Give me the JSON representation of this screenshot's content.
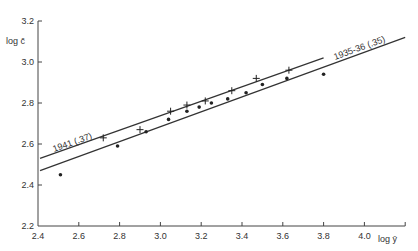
{
  "chart_data": {
    "type": "scatter",
    "title": "",
    "xlabel": "log ȳ",
    "ylabel": "log c̄",
    "xlim": [
      2.4,
      4.2
    ],
    "ylim": [
      2.2,
      3.2
    ],
    "xticks": [
      2.4,
      2.6,
      2.8,
      3.0,
      3.2,
      3.4,
      3.6,
      3.8,
      4.0
    ],
    "xtick_labels": [
      "2.4",
      "2.6",
      "2.8",
      "3.0",
      "3.2",
      "3.4",
      "3.6",
      "3.8",
      "4.0"
    ],
    "yticks": [
      2.2,
      2.4,
      2.6,
      2.8,
      3.0,
      3.2
    ],
    "ytick_labels": [
      "2.2",
      "2.4",
      "2.6",
      "2.8",
      "3.0",
      "3.2"
    ],
    "grid": false,
    "legend": "inline line labels",
    "series": [
      {
        "name": "1941",
        "marker": "plus",
        "x": [
          2.72,
          2.9,
          3.05,
          3.13,
          3.22,
          3.35,
          3.47,
          3.63
        ],
        "y": [
          2.63,
          2.67,
          2.76,
          2.79,
          2.81,
          2.86,
          2.92,
          2.96
        ]
      },
      {
        "name": "1935-36",
        "marker": "dot",
        "x": [
          2.51,
          2.79,
          2.93,
          3.04,
          3.13,
          3.19,
          3.25,
          3.33,
          3.42,
          3.5,
          3.62,
          3.8
        ],
        "y": [
          2.45,
          2.59,
          2.66,
          2.72,
          2.76,
          2.78,
          2.8,
          2.82,
          2.85,
          2.89,
          2.92,
          2.94
        ]
      }
    ],
    "fit_lines": [
      {
        "name": "1941",
        "label": "1941 (.37)",
        "slope": 0.37,
        "x": [
          2.41,
          3.8
        ],
        "y": [
          2.53,
          3.02
        ]
      },
      {
        "name": "1935-36",
        "label": "1935-36 (.35)",
        "slope": 0.35,
        "x": [
          2.41,
          4.2
        ],
        "y": [
          2.47,
          3.12
        ]
      }
    ]
  }
}
